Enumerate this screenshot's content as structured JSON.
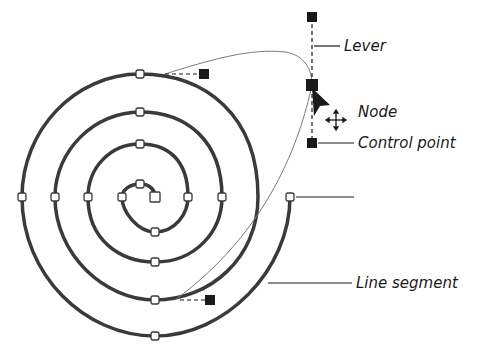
{
  "diagram": {
    "labels": {
      "lever": "Lever",
      "node": "Node",
      "control_point": "Control point",
      "line_segment": "Line segment"
    },
    "icons": {
      "cursor": "arrow-pointer-icon",
      "move": "four-way-move-icon"
    },
    "colors": {
      "stroke": "#3a3a3a",
      "thin_curve": "#7a7a7a",
      "handle_fill": "#1a1a1a",
      "label_text": "#1a1a1a"
    }
  }
}
